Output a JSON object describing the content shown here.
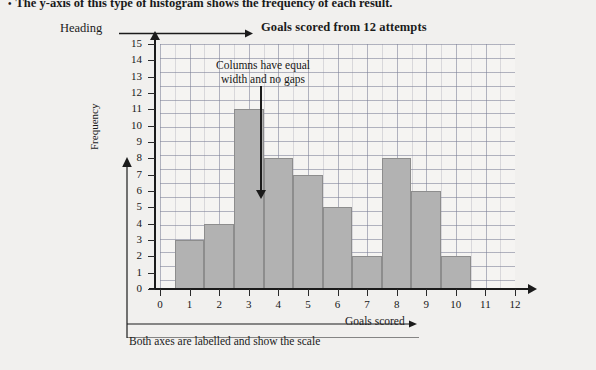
{
  "top_note": {
    "bullet": "•",
    "text": "The y-axis of this type of histogram shows the frequency of each result."
  },
  "annotations": {
    "heading_label": "Heading",
    "columns_note_line1": "Columns have equal",
    "columns_note_line2": "width and no gaps",
    "axes_caption": "Both axes are labelled and show the scale"
  },
  "colors": {
    "bar_fill": "#b2b2b2",
    "bar_stroke": "#8d8d8d",
    "axis": "#1b1b1b",
    "page_bg": "#f1f0ee",
    "plot_bg": "#f5f4f2",
    "grid_minor": "#96969f",
    "grid_major": "#787d96"
  },
  "chart_data": {
    "type": "bar",
    "title": "Goals scored from 12 attempts",
    "xlabel": "Goals scored",
    "ylabel": "Frequency",
    "categories": [
      "1",
      "2",
      "3",
      "4",
      "5",
      "6",
      "7",
      "8",
      "9",
      "10"
    ],
    "values": [
      3,
      4,
      11,
      8,
      7,
      5,
      2,
      8,
      6,
      2
    ],
    "bar_left_edges": [
      0.5,
      1.5,
      2.5,
      3.5,
      4.5,
      5.5,
      6.5,
      7.5,
      8.5,
      9.5
    ],
    "bar_width": 1,
    "xlim": [
      0,
      12
    ],
    "ylim": [
      0,
      15
    ],
    "x_ticks": [
      "0",
      "1",
      "2",
      "3",
      "4",
      "5",
      "6",
      "7",
      "8",
      "9",
      "10",
      "11",
      "12"
    ],
    "y_ticks": [
      "0",
      "1",
      "2",
      "3",
      "4",
      "5",
      "6",
      "7",
      "8",
      "9",
      "10",
      "11",
      "12",
      "13",
      "14",
      "15"
    ],
    "grid": true,
    "legend": null
  }
}
